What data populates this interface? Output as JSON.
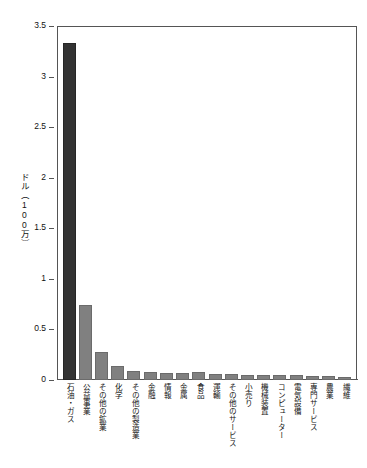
{
  "chart_data": {
    "type": "bar",
    "title": "",
    "xlabel": "",
    "ylabel": "ドル（100万）",
    "ylim": [
      0,
      3.5
    ],
    "ytick_labels": [
      "3.5",
      "3",
      "2.5",
      "2",
      "1.5",
      "1",
      "0.5",
      "0"
    ],
    "ytick_values": [
      3.5,
      3,
      2.5,
      2,
      1.5,
      1,
      0.5,
      0
    ],
    "grid": false,
    "legend": "none",
    "categories": [
      "石油・ガス",
      "公益事業",
      "その他の鉱業",
      "化学",
      "その他の製造業",
      "金融",
      "情報",
      "金属",
      "食品",
      "運輸",
      "その他のサービス",
      "小売り",
      "機械装置",
      "コンピューター",
      "電気設備",
      "専門サービス",
      "農業",
      "繊維"
    ],
    "values": [
      3.33,
      0.74,
      0.28,
      0.14,
      0.09,
      0.075,
      0.07,
      0.07,
      0.075,
      0.06,
      0.06,
      0.05,
      0.05,
      0.05,
      0.045,
      0.04,
      0.04,
      0.025
    ],
    "bar_colors": [
      "#333333",
      "#808080",
      "#808080",
      "#808080",
      "#808080",
      "#808080",
      "#808080",
      "#808080",
      "#808080",
      "#808080",
      "#808080",
      "#808080",
      "#808080",
      "#808080",
      "#808080",
      "#808080",
      "#808080",
      "#808080"
    ],
    "highlight_index": 0,
    "accent_color": "#333333",
    "series_color": "#808080"
  }
}
